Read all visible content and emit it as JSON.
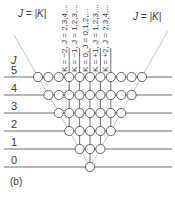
{
  "figure": {
    "panel_label": "(b)",
    "axis_label": "J",
    "boundary_label_left": "J = |K|",
    "boundary_label_right": "J = |K|",
    "rows": [
      {
        "J": 0,
        "label": "0",
        "K_values": [
          0
        ]
      },
      {
        "J": 1,
        "label": "1",
        "K_values": [
          -1,
          0,
          1
        ]
      },
      {
        "J": 2,
        "label": "2",
        "K_values": [
          -2,
          -1,
          0,
          1,
          2
        ]
      },
      {
        "J": 3,
        "label": "3",
        "K_values": [
          -3,
          -2,
          -1,
          0,
          1,
          2,
          3
        ]
      },
      {
        "J": 4,
        "label": "4",
        "K_values": [
          -4,
          -3,
          -2,
          -1,
          0,
          1,
          2,
          3,
          4
        ]
      },
      {
        "J": 5,
        "label": "5",
        "K_values": [
          -5,
          -4,
          -3,
          -2,
          -1,
          0,
          1,
          2,
          3,
          4,
          5
        ]
      }
    ],
    "columns": [
      {
        "K": -2,
        "label": "K = −2, J = 2,3,4,..."
      },
      {
        "K": -1,
        "label": "K = −1, J = 1,2,3,..."
      },
      {
        "K": 0,
        "label": "K = 0, J = 0,1,2,..."
      },
      {
        "K": 1,
        "label": "K = +1, J = 1,2,3,..."
      },
      {
        "K": 2,
        "label": "K = +2, J = 2,3,4,..."
      }
    ],
    "colors": {
      "line": "#6e6e6e",
      "diagonal": "#c8c8c8",
      "node_stroke": "#555555",
      "node_fill": "#ffffff",
      "text": "#3a3a3a"
    }
  }
}
